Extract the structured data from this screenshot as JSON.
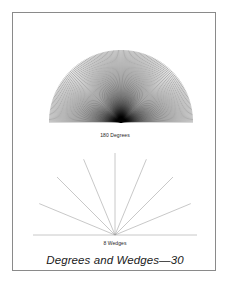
{
  "page": {
    "background_color": "#ffffff",
    "frame_color": "#8a8a8a"
  },
  "title": {
    "text": "Degrees and Wedges—30",
    "style": "italic",
    "color": "#1a1a1a"
  },
  "figures": [
    {
      "id": "degrees",
      "caption": "180 Degrees",
      "line_color": "#000000",
      "line_count": 180,
      "shape": "half-disc-radial-fan",
      "angle_span_degrees": 180,
      "angle_step_degrees": 1
    },
    {
      "id": "wedges",
      "caption": "8 Wedges",
      "line_color": "#9a9a9a",
      "wedge_count": 8,
      "shape": "half-disc-wedge-fan",
      "angle_span_degrees": 180,
      "angle_step_degrees": 22.5,
      "ray_count": 7
    }
  ],
  "chart_data": {
    "type": "line",
    "title": "Degrees and Wedges—30",
    "xlabel": "",
    "ylabel": "",
    "panels": [
      {
        "name": "180 Degrees",
        "caption": "180 Degrees",
        "type": "radial-fan",
        "center": [
          0.5,
          1.0
        ],
        "radius": 1.0,
        "angles_degrees": [
          0,
          1,
          2,
          3,
          4,
          5,
          6,
          7,
          8,
          9,
          10,
          11,
          12,
          13,
          14,
          15,
          16,
          17,
          18,
          19,
          20,
          21,
          22,
          23,
          24,
          25,
          26,
          27,
          28,
          29,
          30,
          31,
          32,
          33,
          34,
          35,
          36,
          37,
          38,
          39,
          40,
          41,
          42,
          43,
          44,
          45,
          46,
          47,
          48,
          49,
          50,
          51,
          52,
          53,
          54,
          55,
          56,
          57,
          58,
          59,
          60,
          61,
          62,
          63,
          64,
          65,
          66,
          67,
          68,
          69,
          70,
          71,
          72,
          73,
          74,
          75,
          76,
          77,
          78,
          79,
          80,
          81,
          82,
          83,
          84,
          85,
          86,
          87,
          88,
          89,
          90,
          91,
          92,
          93,
          94,
          95,
          96,
          97,
          98,
          99,
          100,
          101,
          102,
          103,
          104,
          105,
          106,
          107,
          108,
          109,
          110,
          111,
          112,
          113,
          114,
          115,
          116,
          117,
          118,
          119,
          120,
          121,
          122,
          123,
          124,
          125,
          126,
          127,
          128,
          129,
          130,
          131,
          132,
          133,
          134,
          135,
          136,
          137,
          138,
          139,
          140,
          141,
          142,
          143,
          144,
          145,
          146,
          147,
          148,
          149,
          150,
          151,
          152,
          153,
          154,
          155,
          156,
          157,
          158,
          159,
          160,
          161,
          162,
          163,
          164,
          165,
          166,
          167,
          168,
          169,
          170,
          171,
          172,
          173,
          174,
          175,
          176,
          177,
          178,
          179,
          180
        ],
        "line_count": 181,
        "line_color": "#000000",
        "grid": false,
        "legend": "none"
      },
      {
        "name": "8 Wedges",
        "caption": "8 Wedges",
        "type": "radial-fan",
        "center": [
          0.5,
          1.0
        ],
        "radius": 1.0,
        "angles_degrees": [
          0,
          22.5,
          45,
          67.5,
          90,
          112.5,
          135,
          157.5,
          180
        ],
        "line_count": 9,
        "line_color": "#9a9a9a",
        "grid": false,
        "legend": "none"
      }
    ]
  }
}
